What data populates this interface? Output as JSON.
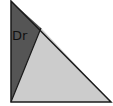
{
  "diagram": {
    "type": "right-triangle-partition",
    "regions": [
      {
        "name": "dark-region",
        "label": "Dr",
        "color": "#555555"
      },
      {
        "name": "light-region",
        "label": "",
        "color": "#cccccc"
      }
    ],
    "outline_color": "#1a1a1a"
  }
}
